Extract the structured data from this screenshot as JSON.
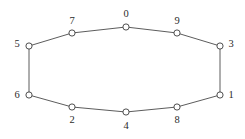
{
  "figure": {
    "name": "cycle-graph",
    "width": 245,
    "height": 139,
    "background_color": "#ffffff",
    "edge_color": "#4a4a4a",
    "node_fill_color": "#ffffff",
    "node_stroke_color": "#3c3c3c",
    "label_color": "#2b2b2b",
    "node_radius": 3.1
  },
  "chart_data": {
    "type": "diagram",
    "subtype": "undirected-cycle-graph",
    "title": "",
    "xlabel": "",
    "ylabel": "",
    "node_count": 10,
    "edge_count": 10,
    "nodes": [
      {
        "id": "0",
        "label": "0",
        "x": 126,
        "y": 27,
        "label_x": 126,
        "label_y": 14,
        "label_position": "above"
      },
      {
        "id": "7",
        "label": "7",
        "x": 72,
        "y": 33,
        "label_x": 72,
        "label_y": 21,
        "label_position": "above"
      },
      {
        "id": "9",
        "label": "9",
        "x": 177,
        "y": 33,
        "label_x": 177,
        "label_y": 21,
        "label_position": "above"
      },
      {
        "id": "5",
        "label": "5",
        "x": 29,
        "y": 46,
        "label_x": 17,
        "label_y": 44,
        "label_position": "left"
      },
      {
        "id": "3",
        "label": "3",
        "x": 220,
        "y": 46,
        "label_x": 231,
        "label_y": 44,
        "label_position": "right"
      },
      {
        "id": "6",
        "label": "6",
        "x": 29,
        "y": 95,
        "label_x": 17,
        "label_y": 95,
        "label_position": "left"
      },
      {
        "id": "1",
        "label": "1",
        "x": 220,
        "y": 95,
        "label_x": 231,
        "label_y": 95,
        "label_position": "right"
      },
      {
        "id": "2",
        "label": "2",
        "x": 72,
        "y": 107,
        "label_x": 72,
        "label_y": 120,
        "label_position": "below"
      },
      {
        "id": "8",
        "label": "8",
        "x": 177,
        "y": 107,
        "label_x": 177,
        "label_y": 120,
        "label_position": "below"
      },
      {
        "id": "4",
        "label": "4",
        "x": 126,
        "y": 112,
        "label_x": 126,
        "label_y": 126,
        "label_position": "below"
      }
    ],
    "edges": [
      {
        "from": "0",
        "to": "7"
      },
      {
        "from": "7",
        "to": "5"
      },
      {
        "from": "5",
        "to": "6"
      },
      {
        "from": "6",
        "to": "2"
      },
      {
        "from": "2",
        "to": "4"
      },
      {
        "from": "4",
        "to": "8"
      },
      {
        "from": "8",
        "to": "1"
      },
      {
        "from": "1",
        "to": "3"
      },
      {
        "from": "3",
        "to": "9"
      },
      {
        "from": "9",
        "to": "0"
      }
    ],
    "cycle_order": [
      "0",
      "9",
      "3",
      "1",
      "8",
      "4",
      "2",
      "6",
      "5",
      "7"
    ]
  }
}
